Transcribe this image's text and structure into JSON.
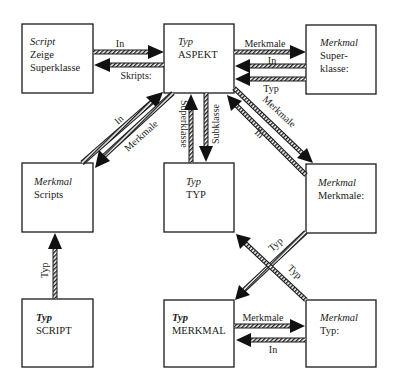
{
  "diagram": {
    "boxes": {
      "script_zeige": {
        "kind": "Script",
        "lines": [
          "Zeige",
          "Superklasse"
        ]
      },
      "typ_aspekt": {
        "kind": "Typ",
        "lines": [
          "ASPEKT"
        ]
      },
      "merkmal_superklasse": {
        "kind": "Merkmal",
        "lines": [
          "Super-",
          "klasse:"
        ]
      },
      "merkmal_scripts": {
        "kind": "Merkmal",
        "lines": [
          "Scripts"
        ]
      },
      "typ_typ": {
        "kind": "Typ",
        "lines": [
          "TYP"
        ]
      },
      "merkmal_merkmale": {
        "kind": "Merkmal",
        "lines": [
          "Merkmale:"
        ]
      },
      "typ_script": {
        "kind": "Typ",
        "lines": [
          "SCRIPT"
        ]
      },
      "typ_merkmal": {
        "kind": "Typ",
        "lines": [
          "MERKMAL"
        ]
      },
      "merkmal_typ": {
        "kind": "Merkmal",
        "lines": [
          "Typ:"
        ]
      }
    },
    "arrows": {
      "zeige_to_aspekt_in": "In",
      "aspekt_to_zeige_skripts": "Skripts:",
      "aspekt_to_superklasse_merkmale": "Merkmale",
      "superklasse_to_aspekt_in": "In",
      "superklasse_to_aspekt_typ": "Typ",
      "scripts_to_aspekt_in": "In",
      "aspekt_to_scripts_merkmale": "Merkmale",
      "typ_to_aspekt_superklasse": "Superklasse",
      "aspekt_to_typ_subklasse": "Subklasse",
      "aspekt_to_merkmale_merkmale": "Merkmale",
      "merkmale_to_aspekt_in": "In",
      "script_to_scripts_typ": "Typ",
      "merkmale_to_merkmal_typ": "Typ",
      "merkmaltyp_to_typ_typ": "Typ",
      "merkmal_to_merkmaltyp_merkmale": "Merkmale",
      "merkmaltyp_to_merkmal_in": "In"
    },
    "colors": {
      "ink": "#1a1a1a",
      "paper": "#ffffff"
    }
  }
}
